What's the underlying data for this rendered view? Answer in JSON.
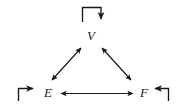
{
  "figure": {
    "type": "diagram",
    "kind": "directed-graph",
    "background_color": "#ffffff",
    "stroke_color": "#1a1a1a",
    "width": 178,
    "height": 112
  },
  "nodes": [
    {
      "id": "V",
      "label": "V",
      "position": "top-center",
      "x": 92,
      "y": 36
    },
    {
      "id": "E",
      "label": "E",
      "position": "bottom-left",
      "x": 48,
      "y": 93
    },
    {
      "id": "F",
      "label": "F",
      "position": "bottom-right",
      "x": 144,
      "y": 93
    }
  ],
  "edges": [
    {
      "id": "e-v",
      "from": "E",
      "to": "V",
      "style": "double-headed",
      "orientation": "diagonal-left"
    },
    {
      "id": "v-f",
      "from": "V",
      "to": "F",
      "style": "double-headed",
      "orientation": "diagonal-right"
    },
    {
      "id": "e-f",
      "from": "E",
      "to": "F",
      "style": "double-headed",
      "orientation": "horizontal"
    }
  ],
  "self_loops": [
    {
      "id": "loop-v",
      "node": "V",
      "placement": "above",
      "arrow_direction": "down"
    },
    {
      "id": "loop-e",
      "node": "E",
      "placement": "left",
      "arrow_direction": "right"
    },
    {
      "id": "loop-f",
      "node": "F",
      "placement": "right",
      "arrow_direction": "left"
    }
  ]
}
